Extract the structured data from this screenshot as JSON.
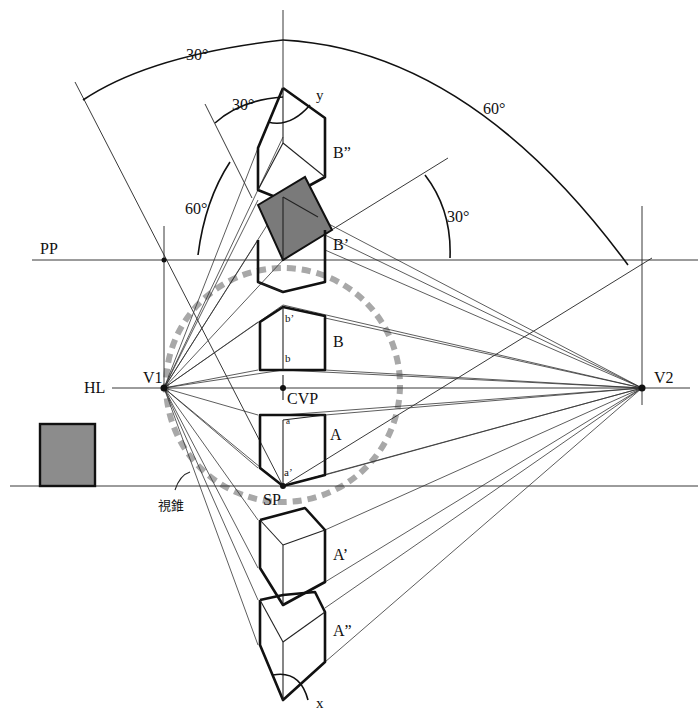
{
  "diagram": {
    "colors": {
      "line": "#222222",
      "bold_line": "#111111",
      "shaded_face": "#7a7a7a",
      "cone_of_vision": "#a8a8a8",
      "background": "#ffffff"
    },
    "lines": {
      "picture_plane": "PP",
      "horizon_line": "HL",
      "ground_line": ""
    },
    "points": {
      "v1": "V1",
      "v2": "V2",
      "cvp": "CVP",
      "sp": "SP"
    },
    "cubes": {
      "b_double": "B”",
      "b_prime": "B’",
      "b": "B",
      "a": "A",
      "a_prime": "A’",
      "a_double": "A”"
    },
    "sub_labels": {
      "b_prime_small": "b’",
      "b_small": "b",
      "a_small": "a",
      "a_prime_small": "a’"
    },
    "axes": {
      "y": "y",
      "x": "x"
    },
    "angles": {
      "top_left": "30°",
      "top_right": "60°",
      "inner_30": "30°",
      "inner_60": "60°",
      "right_30": "30°"
    },
    "annotation": {
      "cone_of_vision": "視錐"
    }
  }
}
